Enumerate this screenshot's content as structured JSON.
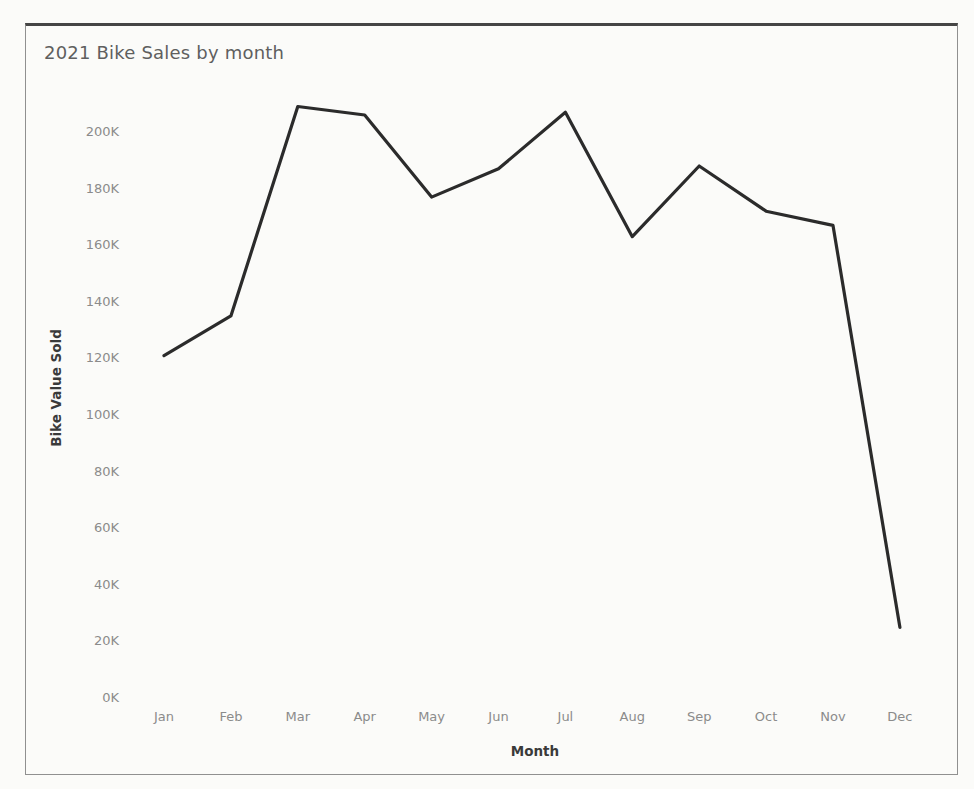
{
  "chart": {
    "title": "2021 Bike Sales by month",
    "colors": {
      "background": "#fbfbf9",
      "line": "#2b2b2b",
      "tick_label": "#8b8b8b",
      "title": "#5f5f5f",
      "axis_title": "#3a3a3a",
      "border": "#909090",
      "border_top": "#454545"
    }
  },
  "chart_data": {
    "type": "line",
    "title": "2021 Bike Sales by month",
    "xlabel": "Month",
    "ylabel": "Bike Value Sold",
    "categories": [
      "Jan",
      "Feb",
      "Mar",
      "Apr",
      "May",
      "Jun",
      "Jul",
      "Aug",
      "Sep",
      "Oct",
      "Nov",
      "Dec"
    ],
    "series": [
      {
        "name": "Bike Value Sold",
        "unit": "K",
        "values": [
          121,
          135,
          209,
          206,
          177,
          187,
          207,
          163,
          188,
          172,
          167,
          25
        ]
      }
    ],
    "ylim": [
      0,
      220
    ],
    "ytick_step": 20,
    "yticks": [
      {
        "value": 0,
        "label": "0K"
      },
      {
        "value": 20,
        "label": "20K"
      },
      {
        "value": 40,
        "label": "40K"
      },
      {
        "value": 60,
        "label": "60K"
      },
      {
        "value": 80,
        "label": "80K"
      },
      {
        "value": 100,
        "label": "100K"
      },
      {
        "value": 120,
        "label": "120K"
      },
      {
        "value": 140,
        "label": "140K"
      },
      {
        "value": 160,
        "label": "160K"
      },
      {
        "value": 180,
        "label": "180K"
      },
      {
        "value": 200,
        "label": "200K"
      }
    ],
    "grid": false,
    "legend": "none"
  }
}
